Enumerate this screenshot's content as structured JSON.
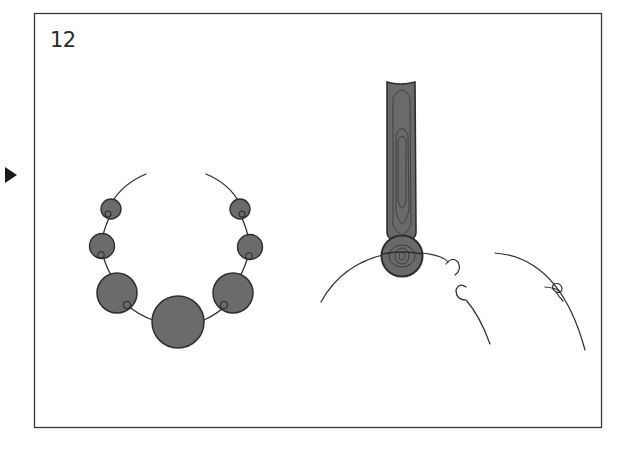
{
  "step": {
    "number": "12"
  },
  "colors": {
    "frame": "#3a3a3a",
    "bead_fill": "#6b6b6b",
    "bead_stroke": "#2e2e2e",
    "wood_fill": "#6a6a6a",
    "wood_grain": "#3c3c3c",
    "line": "#2e2e2e",
    "arrow": "#1a1a1a"
  },
  "icons": {
    "pointer": "play-triangle-icon"
  },
  "diagram": {
    "left_panel": {
      "description": "Bead necklace strung on a curved cord",
      "beads": [
        {
          "id": "left-small",
          "cx": 111,
          "cy": 209,
          "r": 10
        },
        {
          "id": "left-mid",
          "cx": 102,
          "cy": 246,
          "r": 12
        },
        {
          "id": "left-large",
          "cx": 117,
          "cy": 293,
          "r": 20
        },
        {
          "id": "center-largest",
          "cx": 178,
          "cy": 322,
          "r": 26
        },
        {
          "id": "right-large",
          "cx": 233,
          "cy": 293,
          "r": 20
        },
        {
          "id": "right-mid",
          "cx": 250,
          "cy": 247,
          "r": 12
        },
        {
          "id": "right-small",
          "cx": 240,
          "cy": 209,
          "r": 10
        }
      ]
    },
    "right_panel": {
      "description": "Wooden stick with round bead end resting on a curved cord, with knot detail"
    }
  }
}
